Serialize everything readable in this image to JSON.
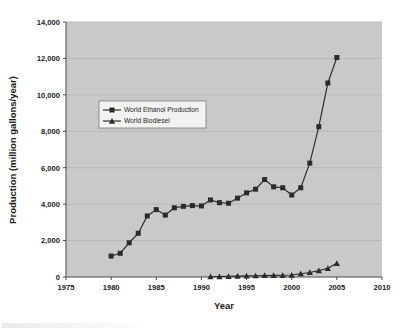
{
  "chart_data": {
    "type": "line",
    "title": "",
    "xlabel": "Year",
    "ylabel": "Production (million gallons/year)",
    "xlim": [
      1975,
      2010
    ],
    "ylim": [
      0,
      14000
    ],
    "xticks": [
      "1975",
      "1980",
      "1985",
      "1990",
      "1995",
      "2000",
      "2005",
      "2010"
    ],
    "yticks": [
      "0",
      "2,000",
      "4,000",
      "6,000",
      "8,000",
      "10,000",
      "12,000",
      "14,000"
    ],
    "grid": true,
    "legend_position": "upper-left-inside",
    "plot_background": "#c9c9c7",
    "series_color": "#2b2b2b",
    "series": [
      {
        "name": "World Ethanol Production",
        "marker": "square",
        "x": [
          1980,
          1981,
          1982,
          1983,
          1984,
          1985,
          1986,
          1987,
          1988,
          1989,
          1990,
          1991,
          1992,
          1993,
          1994,
          1995,
          1996,
          1997,
          1998,
          1999,
          2000,
          2001,
          2002,
          2003,
          2004,
          2005
        ],
        "values": [
          1150,
          1300,
          1880,
          2400,
          3350,
          3700,
          3400,
          3800,
          3880,
          3920,
          3900,
          4230,
          4080,
          4050,
          4330,
          4620,
          4820,
          5350,
          4950,
          4900,
          4500,
          4900,
          6250,
          8250,
          10650,
          12050
        ]
      },
      {
        "name": "World Biodiesel",
        "marker": "triangle",
        "x": [
          1991,
          1992,
          1993,
          1994,
          1995,
          1996,
          1997,
          1998,
          1999,
          2000,
          2001,
          2002,
          2003,
          2004,
          2005
        ],
        "values": [
          20,
          25,
          35,
          45,
          60,
          70,
          85,
          90,
          95,
          110,
          180,
          250,
          350,
          480,
          750
        ]
      }
    ]
  },
  "axis": {
    "y_title": "Production (million gallons/year)",
    "x_title": "Year"
  },
  "legend": {
    "entries": [
      {
        "label": "World Ethanol Production",
        "marker": "square-marker-icon"
      },
      {
        "label": "World Biodiesel",
        "marker": "triangle-marker-icon"
      }
    ]
  }
}
